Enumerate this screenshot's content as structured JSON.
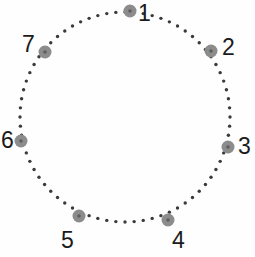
{
  "figure": {
    "type": "cycle-graph-diagram",
    "background_color": "#fefefe",
    "circle": {
      "center_x": 125,
      "center_y": 117,
      "radius": 105,
      "stroke_style": "dotted",
      "dot_color": "#3a3a3a",
      "dot_radius": 1.7,
      "dot_count": 72
    },
    "node_style": {
      "fill_color": "#8c8c8c",
      "core_color": "#5e5e5e",
      "radius": 6.5,
      "core_radius": 1.8
    },
    "nodes": [
      {
        "id": "node-1",
        "label": "1",
        "angle_deg": -90,
        "cx": 130,
        "cy": 11,
        "label_x": 138,
        "label_y": 2
      },
      {
        "id": "node-2",
        "label": "2",
        "angle_deg": -38,
        "cx": 211,
        "cy": 51,
        "label_x": 222,
        "label_y": 36
      },
      {
        "id": "node-3",
        "label": "3",
        "angle_deg": 13,
        "cx": 228,
        "cy": 147,
        "label_x": 238,
        "label_y": 135
      },
      {
        "id": "node-4",
        "label": "4",
        "angle_deg": 64,
        "cx": 168,
        "cy": 220,
        "label_x": 172,
        "label_y": 229
      },
      {
        "id": "node-5",
        "label": "5",
        "angle_deg": 116,
        "cx": 79,
        "cy": 216,
        "label_x": 61,
        "label_y": 229
      },
      {
        "id": "node-6",
        "label": "6",
        "angle_deg": 167,
        "cx": 21,
        "cy": 141,
        "label_x": 1,
        "label_y": 129
      },
      {
        "id": "node-7",
        "label": "7",
        "angle_deg": -141,
        "cx": 45,
        "cy": 52,
        "label_x": 22,
        "label_y": 33
      }
    ]
  },
  "chart_data": {
    "type": "scatter",
    "title": "",
    "xlabel": "",
    "ylabel": "",
    "annotations": [
      "1",
      "2",
      "3",
      "4",
      "5",
      "6",
      "7"
    ],
    "x": [
      130,
      211,
      228,
      168,
      79,
      21,
      45
    ],
    "y": [
      11,
      51,
      147,
      220,
      216,
      141,
      52
    ],
    "grid": false,
    "legend": "none"
  }
}
